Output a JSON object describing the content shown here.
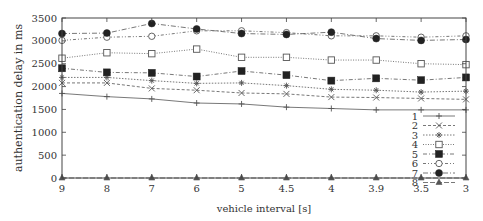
{
  "chart_data": {
    "type": "line",
    "title": "",
    "xlabel": "vehicle interval [s]",
    "ylabel": "authentication delay in ms",
    "categories": [
      "9",
      "8",
      "7",
      "6",
      "5",
      "4.5",
      "4",
      "3.9",
      "3.5",
      "3"
    ],
    "ylim": [
      0,
      3500
    ],
    "yticks": [
      0,
      500,
      1000,
      1500,
      2000,
      2500,
      3000,
      3500
    ],
    "grid": false,
    "legend_position": "inside lower right",
    "series": [
      {
        "name": "1",
        "marker": "plus",
        "dash": "solid",
        "values": [
          1850,
          1780,
          1730,
          1640,
          1620,
          1550,
          1520,
          1490,
          1490,
          1490
        ]
      },
      {
        "name": "2",
        "marker": "cross",
        "dash": "dashed",
        "values": [
          2080,
          2080,
          1960,
          1920,
          1860,
          1840,
          1770,
          1760,
          1740,
          1720
        ]
      },
      {
        "name": "3",
        "marker": "asterisk",
        "dash": "dotted",
        "values": [
          2200,
          2200,
          2130,
          2070,
          2080,
          2020,
          1940,
          1920,
          1880,
          1900
        ]
      },
      {
        "name": "4",
        "marker": "open-square",
        "dash": "dotted-fine",
        "values": [
          2620,
          2740,
          2720,
          2820,
          2640,
          2640,
          2580,
          2580,
          2500,
          2480
        ]
      },
      {
        "name": "5",
        "marker": "filled-square",
        "dash": "dash-dot",
        "values": [
          2400,
          2310,
          2300,
          2220,
          2340,
          2250,
          2130,
          2180,
          2140,
          2200
        ]
      },
      {
        "name": "6",
        "marker": "open-circle",
        "dash": "dash-dot-dot",
        "values": [
          3010,
          3080,
          3100,
          3220,
          3220,
          3180,
          3110,
          3110,
          3080,
          3110
        ]
      },
      {
        "name": "7",
        "marker": "filled-circle",
        "dash": "long-dash-dot",
        "values": [
          3160,
          3170,
          3380,
          3260,
          3160,
          3140,
          3190,
          3050,
          3010,
          3030
        ]
      },
      {
        "name": "8",
        "marker": "triangle",
        "dash": "long-dash",
        "values": [
          0,
          0,
          0,
          0,
          0,
          0,
          0,
          0,
          0,
          0
        ]
      }
    ]
  },
  "axes": {
    "xlabel": "vehicle interval [s]",
    "ylabel": "authentication delay in ms"
  },
  "legend": {
    "entries": [
      "1",
      "2",
      "3",
      "4",
      "5",
      "6",
      "7",
      "8"
    ]
  }
}
